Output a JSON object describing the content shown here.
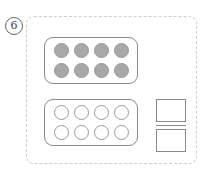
{
  "problem": {
    "number": "6",
    "top_frame": {
      "filled": [
        true,
        true,
        true,
        true,
        true,
        true,
        true,
        true
      ]
    },
    "bottom_frame": {
      "filled": [
        false,
        false,
        false,
        false,
        false,
        false,
        false,
        false
      ]
    },
    "answer_boxes": [
      "",
      ""
    ],
    "colors": {
      "dot_fill": "#a8a8a8",
      "outline": "#8a8a8a",
      "dashed_border": "#cfcfcf"
    }
  }
}
